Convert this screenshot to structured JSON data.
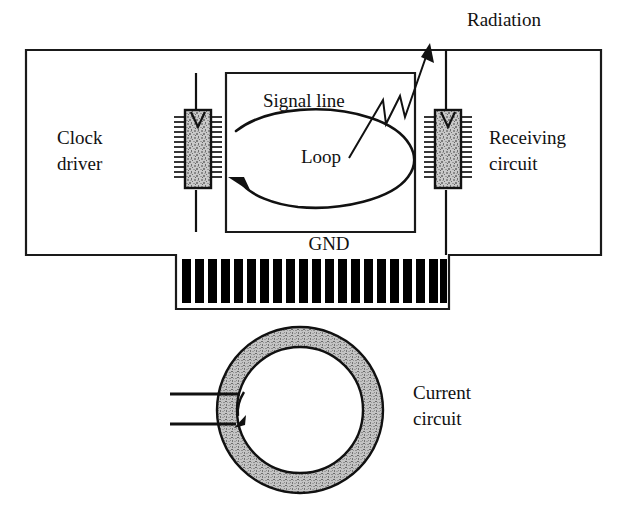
{
  "figure": {
    "kind": "technical-schematic",
    "background_color": "#ffffff",
    "ink_color": "#111111"
  },
  "labels": {
    "radiation": "Radiation",
    "signal_line": "Signal line",
    "loop": "Loop",
    "gnd": "GND",
    "clock_driver_line1": "Clock",
    "clock_driver_line2": "driver",
    "receiving_circuit_line1": "Receiving",
    "receiving_circuit_line2": "circuit",
    "current_circuit_line1": "Current",
    "current_circuit_line2": "circuit"
  },
  "board": {
    "outline_color": "#1a1a1a",
    "fill_color": "#ffffff"
  },
  "ics": {
    "clock_driver": {
      "name": "clock-driver-ic",
      "pin_count_per_side": 13,
      "fill_color": "#b9b9b9",
      "border_color": "#111111"
    },
    "receiving_circuit": {
      "name": "receiving-circuit-ic",
      "pin_count_per_side": 13,
      "fill_color": "#b9b9b9",
      "border_color": "#111111"
    }
  },
  "connector": {
    "name": "edge-connector",
    "bar_count": 21,
    "bar_color": "#000000"
  },
  "ring": {
    "name": "current-loop-ring",
    "fill_color": "#b5b5b5",
    "border_color": "#111111",
    "lead_count": 2
  }
}
